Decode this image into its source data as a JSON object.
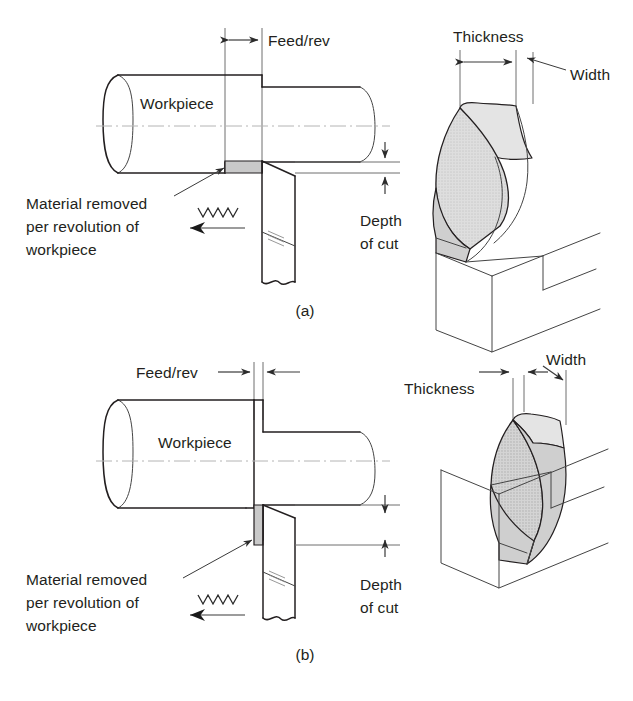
{
  "figure": {
    "background_color": "#ffffff",
    "ink_color": "#231f20",
    "chip_fill_color": "#d8d8d8",
    "removed_material_color": "#c9c9c9",
    "centerline_color": "#b4b4b4"
  },
  "panels": [
    {
      "id": "a",
      "caption": "(a)",
      "description": "Large feed per revolution, small depth of cut",
      "labels": {
        "feed": "Feed/rev",
        "workpiece": "Workpiece",
        "material_removed_line1": "Material removed",
        "material_removed_line2": "per revolution of",
        "material_removed_line3": "workpiece",
        "depth_line1": "Depth",
        "depth_line2": "of cut",
        "thickness": "Thickness",
        "width": "Width"
      }
    },
    {
      "id": "b",
      "caption": "(b)",
      "description": "Small feed per revolution, large depth of cut",
      "labels": {
        "feed": "Feed/rev",
        "workpiece": "Workpiece",
        "material_removed_line1": "Material removed",
        "material_removed_line2": "per revolution of",
        "material_removed_line3": "workpiece",
        "depth_line1": "Depth",
        "depth_line2": "of cut",
        "thickness": "Thickness",
        "width": "Width"
      }
    }
  ],
  "icons": {
    "feed_arrow": "double-headed-dimension-arrow",
    "depth_arrow": "vertical-dimension-arrow",
    "tool_motion": "left-pointing-arrow",
    "vibration": "zigzag-spring-symbol",
    "leader": "leader-line-with-arrowhead"
  }
}
